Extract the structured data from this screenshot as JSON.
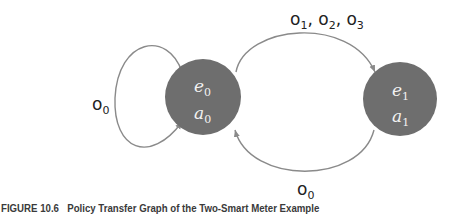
{
  "diagram": {
    "nodes": [
      {
        "id": "state-0",
        "label_e": "e",
        "sub_e": "0",
        "label_a": "a",
        "sub_a": "0",
        "fill": "#6e6e6e"
      },
      {
        "id": "state-1",
        "label_e": "e",
        "sub_e": "1",
        "label_a": "a",
        "sub_a": "1",
        "fill": "#6e6e6e"
      }
    ],
    "edges": [
      {
        "from": "state-0",
        "to": "state-0",
        "label": "o",
        "sub": "0"
      },
      {
        "from": "state-0",
        "to": "state-1",
        "label_parts": [
          {
            "label": "o",
            "sub": "1"
          },
          {
            "label": "o",
            "sub": "2"
          },
          {
            "label": "o",
            "sub": "3"
          }
        ]
      },
      {
        "from": "state-1",
        "to": "state-0",
        "label": "o",
        "sub": "0"
      }
    ],
    "edge_color": "#8a8a8a"
  },
  "caption": {
    "figure_number": "FIGURE 10.6",
    "text": "Policy Transfer Graph of the Two-Smart Meter Example"
  }
}
